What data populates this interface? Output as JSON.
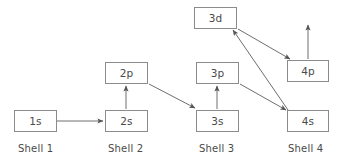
{
  "diagram": {
    "colors": {
      "box_border": "#8b8b8b",
      "box_fill": "#ffffff",
      "text": "#4a4a4a",
      "arrow": "#6e6e6e",
      "background": "#ffffff"
    },
    "orbitals": [
      {
        "label": "1s",
        "x": 14,
        "y": 110,
        "w": 43,
        "h": 22
      },
      {
        "label": "2p",
        "x": 105,
        "y": 62,
        "w": 43,
        "h": 22
      },
      {
        "label": "2s",
        "x": 105,
        "y": 110,
        "w": 43,
        "h": 22
      },
      {
        "label": "3p",
        "x": 196,
        "y": 62,
        "w": 43,
        "h": 22
      },
      {
        "label": "3s",
        "x": 196,
        "y": 110,
        "w": 43,
        "h": 22
      },
      {
        "label": "3d",
        "x": 194,
        "y": 7,
        "w": 43,
        "h": 22
      },
      {
        "label": "4p",
        "x": 287,
        "y": 60,
        "w": 42,
        "h": 22
      },
      {
        "label": "4s",
        "x": 287,
        "y": 110,
        "w": 42,
        "h": 22
      }
    ],
    "shell_labels": [
      {
        "text": "Shell 1",
        "x": 18,
        "y": 144
      },
      {
        "text": "Shell 2",
        "x": 108,
        "y": 144
      },
      {
        "text": "Shell 3",
        "x": 199,
        "y": 144
      },
      {
        "text": "Shell 4",
        "x": 288,
        "y": 144
      }
    ],
    "arrows": [
      {
        "name": "1s-to-2s",
        "from": "1s",
        "to": "2s",
        "x1": 57,
        "y1": 121,
        "x2": 103,
        "y2": 121
      },
      {
        "name": "2s-to-2p",
        "from": "2s",
        "to": "2p",
        "x1": 126,
        "y1": 109,
        "x2": 126,
        "y2": 86
      },
      {
        "name": "2p-to-3s",
        "from": "2p",
        "to": "3s",
        "x1": 149,
        "y1": 84,
        "x2": 195,
        "y2": 108
      },
      {
        "name": "3s-to-3p",
        "from": "3s",
        "to": "3p",
        "x1": 217,
        "y1": 109,
        "x2": 217,
        "y2": 86
      },
      {
        "name": "3p-to-4s",
        "from": "3p",
        "to": "4s",
        "x1": 240,
        "y1": 84,
        "x2": 286,
        "y2": 110
      },
      {
        "name": "4s-to-3d",
        "from": "4s",
        "to": "3d",
        "x1": 288,
        "y1": 110,
        "x2": 233,
        "y2": 30
      },
      {
        "name": "3d-to-4p",
        "from": "3d",
        "to": "4p",
        "x1": 238,
        "y1": 29,
        "x2": 290,
        "y2": 59
      },
      {
        "name": "4p-upward",
        "from": "4p",
        "to": "",
        "x1": 308,
        "y1": 59,
        "x2": 308,
        "y2": 25
      }
    ]
  }
}
